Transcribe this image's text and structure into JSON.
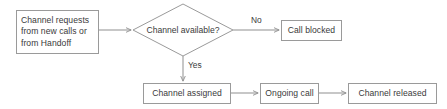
{
  "diagram": {
    "background_color": "#ffffff",
    "stroke_color": "#9a9a9a",
    "text_color": "#3a3a3a",
    "nodes": {
      "channel_requests": {
        "label": "Channel requests\nfrom new calls or\nfrom Handoff",
        "shape": "rectangle"
      },
      "channel_available": {
        "label": "Channel available?",
        "shape": "diamond"
      },
      "call_blocked": {
        "label": "Call blocked",
        "shape": "rectangle"
      },
      "channel_assigned": {
        "label": "Channel assigned",
        "shape": "rectangle"
      },
      "ongoing_call": {
        "label": "Ongoing call",
        "shape": "rectangle"
      },
      "channel_released": {
        "label": "Channel released",
        "shape": "rectangle"
      }
    },
    "edge_labels": {
      "no": "No",
      "yes": "Yes"
    }
  }
}
